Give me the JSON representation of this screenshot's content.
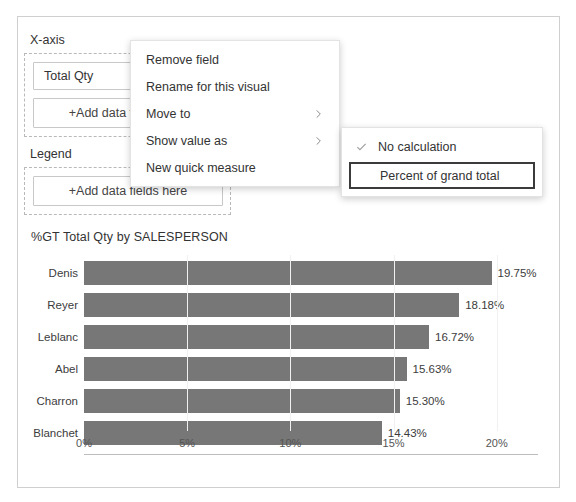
{
  "fields_panel": {
    "xaxis_label": "X-axis",
    "legend_label": "Legend",
    "xaxis_field": "Total Qty",
    "xaxis_add_placeholder": "+Add data fields here",
    "legend_add_placeholder": "+Add data fields here"
  },
  "context_menu": {
    "items": [
      {
        "label": "Remove field",
        "has_submenu": false
      },
      {
        "label": "Rename for this visual",
        "has_submenu": false
      },
      {
        "label": "Move to",
        "has_submenu": true
      },
      {
        "label": "Show value as",
        "has_submenu": true
      },
      {
        "label": "New quick measure",
        "has_submenu": false
      }
    ]
  },
  "submenu": {
    "items": [
      {
        "label": "No calculation",
        "checked": true,
        "highlighted": false
      },
      {
        "label": "Percent of grand total",
        "checked": false,
        "highlighted": true
      }
    ]
  },
  "chart_data": {
    "type": "bar",
    "orientation": "horizontal",
    "title": "%GT Total Qty by SALESPERSON",
    "xlabel": "",
    "ylabel": "",
    "categories": [
      "Denis",
      "Reyer",
      "Leblanc",
      "Abel",
      "Charron",
      "Blanchet"
    ],
    "values": [
      19.75,
      18.18,
      16.72,
      15.63,
      15.3,
      14.43
    ],
    "value_labels": [
      "19.75%",
      "18.18%",
      "16.72%",
      "15.63%",
      "15.30%",
      "14.43%"
    ],
    "xlim": [
      0,
      22.0
    ],
    "tick_values": [
      0,
      5,
      10,
      15,
      20
    ],
    "tick_labels": [
      "0%",
      "5%",
      "10%",
      "15%",
      "20%"
    ],
    "grid": false,
    "legend": false,
    "bar_color": "#777777",
    "axis_color": "#bdbdbd"
  },
  "colors": {
    "panel_border": "#cfcfcf",
    "dashed_border": "#b9b9b9",
    "menu_border": "#e3e3e3",
    "highlight_border": "#3b3b3b",
    "text": "#333333"
  }
}
